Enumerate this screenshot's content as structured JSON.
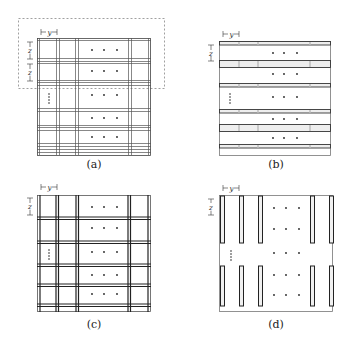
{
  "figure": {
    "panels": [
      {
        "id": "a",
        "caption": "(a)",
        "dim_y_label": "y",
        "dim_z_label": "z",
        "description": "grid of paired thin lines with dashed highlight box around top two rows",
        "has_dashed_box": true
      },
      {
        "id": "b",
        "caption": "(b)",
        "dim_y_label": "y",
        "dim_z_label": "z",
        "description": "horizontal bar strips"
      },
      {
        "id": "c",
        "caption": "(c)",
        "dim_y_label": "y",
        "dim_z_label": "z",
        "description": "grid of thick paired lines"
      },
      {
        "id": "d",
        "caption": "(d)",
        "dim_y_label": "y",
        "dim_z_label": "z",
        "description": "vertical bar strips in two rows"
      }
    ],
    "ellipsis_horizontal": "• • •",
    "ellipsis_vertical": "⋮",
    "colors": {
      "line": "#333333",
      "light_line": "#9a9a9a",
      "fill_bar": "#e6e6e6",
      "dashed": "#777777"
    }
  }
}
